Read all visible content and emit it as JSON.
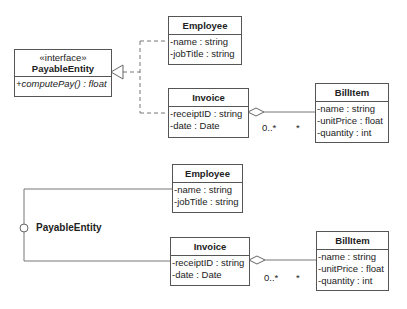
{
  "diagram_top": {
    "interface": {
      "stereotype": "«interface»",
      "name": "PayableEntity",
      "operations": [
        "+computePay() : float"
      ]
    },
    "employee": {
      "name": "Employee",
      "attributes": [
        "-name : string",
        "-jobTitle : string"
      ]
    },
    "invoice": {
      "name": "Invoice",
      "attributes": [
        "-receiptID : string",
        "-date : Date"
      ]
    },
    "billitem": {
      "name": "BillItem",
      "attributes": [
        "-name : string",
        "-unitPrice : float",
        "-quantity : int"
      ]
    },
    "aggregation": {
      "invoice_multiplicity": "0..*",
      "billitem_multiplicity": "*"
    }
  },
  "diagram_bottom": {
    "interface_lollipop_label": "PayableEntity",
    "employee": {
      "name": "Employee",
      "attributes": [
        "-name : string",
        "-jobTitle : string"
      ]
    },
    "invoice": {
      "name": "Invoice",
      "attributes": [
        "-receiptID : string",
        "-date : Date"
      ]
    },
    "billitem": {
      "name": "BillItem",
      "attributes": [
        "-name : string",
        "-unitPrice : float",
        "-quantity : int"
      ]
    },
    "aggregation": {
      "invoice_multiplicity": "0..*",
      "billitem_multiplicity": "*"
    }
  },
  "colors": {
    "line": "#666666",
    "border": "#555555",
    "background": "#ffffff"
  }
}
